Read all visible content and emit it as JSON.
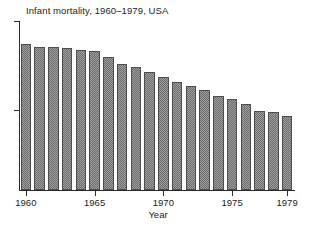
{
  "chart_data": {
    "type": "bar",
    "title": "Infant mortality, 1960–1979, USA",
    "xlabel": "Year",
    "ylabel": "",
    "categories": [
      "1960",
      "1961",
      "1962",
      "1963",
      "1964",
      "1965",
      "1966",
      "1967",
      "1968",
      "1969",
      "1970",
      "1971",
      "1972",
      "1973",
      "1974",
      "1975",
      "1976",
      "1977",
      "1978",
      "1979"
    ],
    "values": [
      26.0,
      25.3,
      25.3,
      25.2,
      24.8,
      24.7,
      23.7,
      22.4,
      21.8,
      20.9,
      20.0,
      19.1,
      18.5,
      17.7,
      16.7,
      16.1,
      15.2,
      14.1,
      13.8,
      13.1
    ],
    "tick_labels": [
      "1960",
      "1965",
      "1970",
      "1975",
      "1979"
    ],
    "tick_indices": [
      0,
      5,
      10,
      15,
      19
    ],
    "ylim": [
      0,
      30
    ],
    "grid": false,
    "legend": null,
    "bar_fill": "#9d9d9d",
    "bar_edge": "#4d4d4d",
    "axis_color": "#2b2b2b",
    "background": "#ffffff"
  },
  "axes": {
    "y_tick_count": 2,
    "x_axis_label": "Year"
  }
}
